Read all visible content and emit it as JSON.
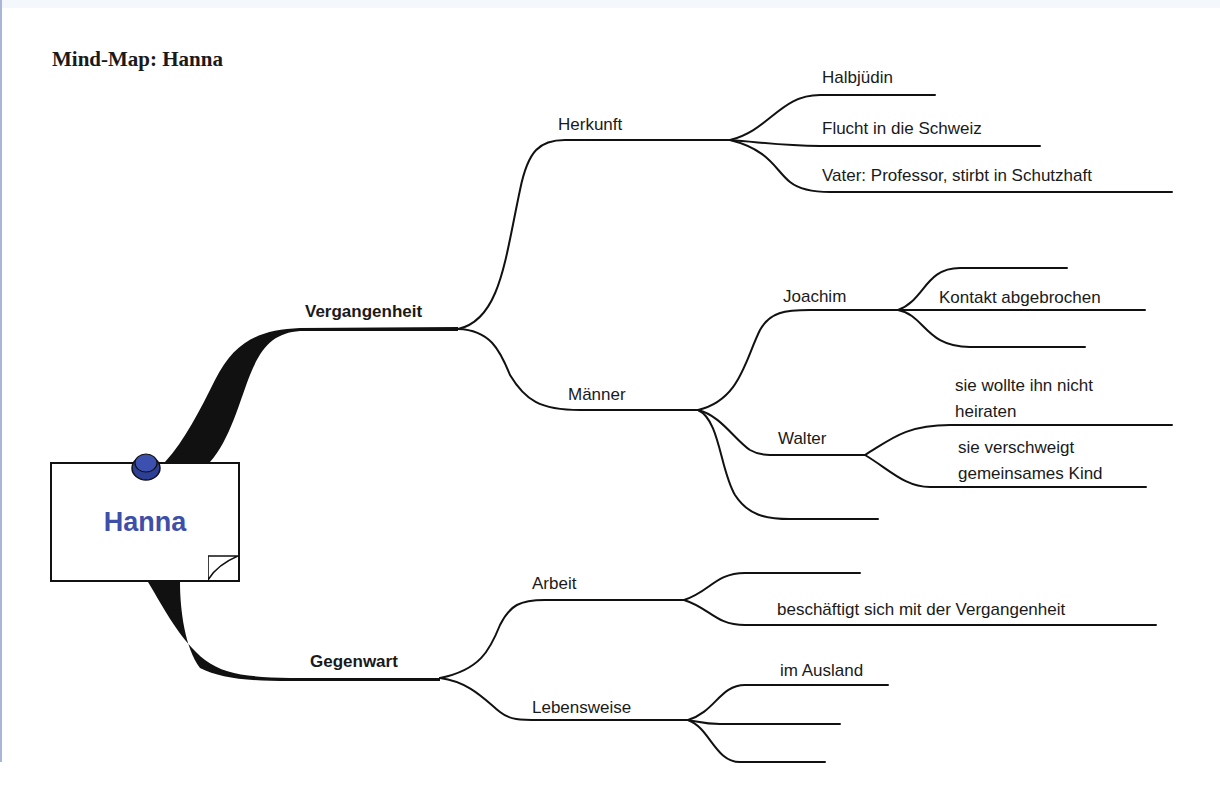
{
  "page": {
    "title": "Mind-Map: Hanna"
  },
  "colors": {
    "accent": "#3d4fa8",
    "pin": "#3c50b0",
    "line": "#111111",
    "left_bar": "#a9b6d8"
  },
  "center": {
    "label": "Hanna",
    "icons": [
      "pushpin-icon",
      "page-curl-icon"
    ]
  },
  "branches": [
    {
      "label": "Vergangenheit",
      "children": [
        {
          "label": "Herkunft",
          "children": [
            {
              "label": "Halbjüdin"
            },
            {
              "label": "Flucht in die Schweiz"
            },
            {
              "label": "Vater: Professor, stirbt in Schutzhaft"
            }
          ]
        },
        {
          "label": "Männer",
          "children": [
            {
              "label": "Joachim",
              "children": [
                {
                  "label": ""
                },
                {
                  "label": "Kontakt abgebrochen"
                },
                {
                  "label": ""
                }
              ]
            },
            {
              "label": "Walter",
              "children": [
                {
                  "label": "sie wollte ihn nicht heiraten"
                },
                {
                  "label": "sie verschweigt gemeinsames Kind"
                }
              ]
            },
            {
              "label": ""
            }
          ]
        }
      ]
    },
    {
      "label": "Gegenwart",
      "children": [
        {
          "label": "Arbeit",
          "children": [
            {
              "label": ""
            },
            {
              "label": "beschäftigt sich mit der Vergangenheit"
            }
          ]
        },
        {
          "label": "Lebensweise",
          "children": [
            {
              "label": "im Ausland"
            },
            {
              "label": ""
            },
            {
              "label": ""
            }
          ]
        }
      ]
    }
  ]
}
